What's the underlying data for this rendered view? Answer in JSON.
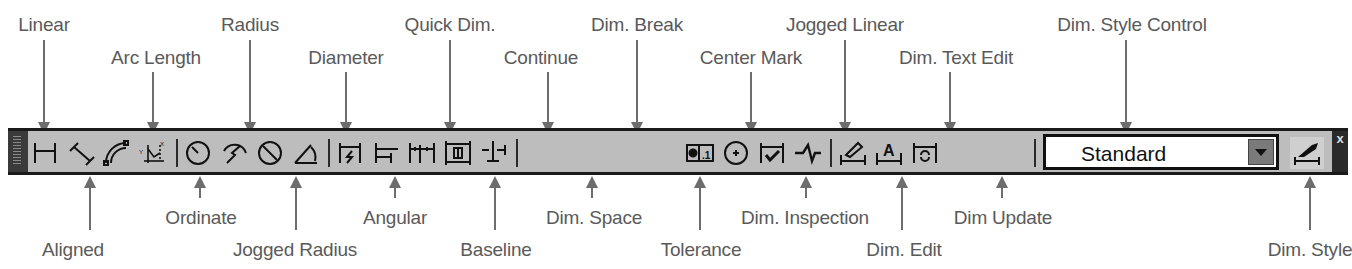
{
  "toolbar": {
    "name": "Dimension",
    "buttons": [
      {
        "id": "linear",
        "label": "Linear",
        "icon": "linear-dimension-icon"
      },
      {
        "id": "aligned",
        "label": "Aligned",
        "icon": "aligned-dimension-icon"
      },
      {
        "id": "arc_length",
        "label": "Arc Length",
        "icon": "arc-length-icon"
      },
      {
        "id": "ordinate",
        "label": "Ordinate",
        "icon": "ordinate-icon"
      },
      {
        "id": "radius",
        "label": "Radius",
        "icon": "radius-icon"
      },
      {
        "id": "jogged_radius",
        "label": "Jogged Radius",
        "icon": "jogged-radius-icon"
      },
      {
        "id": "diameter",
        "label": "Diameter",
        "icon": "diameter-icon"
      },
      {
        "id": "angular",
        "label": "Angular",
        "icon": "angular-icon"
      },
      {
        "id": "quick_dim",
        "label": "Quick Dim.",
        "icon": "quick-dimension-icon"
      },
      {
        "id": "baseline",
        "label": "Baseline",
        "icon": "baseline-icon"
      },
      {
        "id": "continue",
        "label": "Continue",
        "icon": "continue-icon"
      },
      {
        "id": "dim_space",
        "label": "Dim. Space",
        "icon": "dim-space-icon"
      },
      {
        "id": "dim_break",
        "label": "Dim. Break",
        "icon": "dim-break-icon"
      },
      {
        "id": "tolerance",
        "label": "Tolerance",
        "icon": "tolerance-icon"
      },
      {
        "id": "center_mark",
        "label": "Center Mark",
        "icon": "center-mark-icon"
      },
      {
        "id": "dim_inspection",
        "label": "Dim. Inspection",
        "icon": "dim-inspection-icon"
      },
      {
        "id": "jogged_linear",
        "label": "Jogged Linear",
        "icon": "jogged-linear-icon"
      },
      {
        "id": "dim_edit",
        "label": "Dim. Edit",
        "icon": "dim-edit-icon"
      },
      {
        "id": "dim_text_edit",
        "label": "Dim. Text Edit",
        "icon": "dim-text-edit-icon"
      },
      {
        "id": "dim_update",
        "label": "Dim Update",
        "icon": "dim-update-icon"
      },
      {
        "id": "dim_style",
        "label": "Dim. Style",
        "icon": "dim-style-icon"
      }
    ],
    "style_control": {
      "label": "Dim. Style Control",
      "value": "Standard"
    },
    "close_glyph": "x"
  },
  "callouts": {
    "top": [
      {
        "text": "Linear",
        "x": 44,
        "y": 14,
        "ax": 44,
        "ay1": 40,
        "ay2": 137
      },
      {
        "text": "Arc Length",
        "x": 156,
        "y": 47,
        "ax": 153,
        "ay1": 70,
        "ay2": 137
      },
      {
        "text": "Radius",
        "x": 250,
        "y": 14,
        "ax": 250,
        "ay1": 40,
        "ay2": 137
      },
      {
        "text": "Diameter",
        "x": 346,
        "y": 47,
        "ax": 346,
        "ay1": 70,
        "ay2": 137
      },
      {
        "text": "Quick Dim.",
        "x": 450,
        "y": 14,
        "ax": 450,
        "ay1": 40,
        "ay2": 137
      },
      {
        "text": "Continue",
        "x": 541,
        "y": 47,
        "ax": 548,
        "ay1": 70,
        "ay2": 137
      },
      {
        "text": "Dim. Break",
        "x": 637,
        "y": 14,
        "ax": 637,
        "ay1": 40,
        "ay2": 137
      },
      {
        "text": "Center Mark",
        "x": 751,
        "y": 47,
        "ax": 751,
        "ay1": 70,
        "ay2": 137
      },
      {
        "text": "Jogged Linear",
        "x": 845,
        "y": 14,
        "ax": 845,
        "ay1": 40,
        "ay2": 137
      },
      {
        "text": "Dim. Text Edit",
        "x": 956,
        "y": 47,
        "ax": 890,
        "ay1": 70,
        "ay2": 137
      },
      {
        "text": "Dim. Style Control",
        "x": 1132,
        "y": 14,
        "ax": 1126,
        "ay1": 40,
        "ay2": 137
      }
    ],
    "bottom": [
      {
        "text": "Aligned",
        "x": 73,
        "y": 239,
        "ax": 90,
        "ay1": 178,
        "ay2": 232
      },
      {
        "text": "Ordinate",
        "x": 201,
        "y": 207,
        "ax": 200,
        "ay1": 178,
        "ay2": 200
      },
      {
        "text": "Jogged Radius",
        "x": 295,
        "y": 239,
        "ax": 296,
        "ay1": 178,
        "ay2": 232
      },
      {
        "text": "Angular",
        "x": 395,
        "y": 207,
        "ax": 395,
        "ay1": 178,
        "ay2": 200
      },
      {
        "text": "Baseline",
        "x": 496,
        "y": 239,
        "ax": 495,
        "ay1": 178,
        "ay2": 232
      },
      {
        "text": "Dim. Space",
        "x": 594,
        "y": 207,
        "ax": 592,
        "ay1": 178,
        "ay2": 200
      },
      {
        "text": "Tolerance",
        "x": 701,
        "y": 239,
        "ax": 700,
        "ay1": 178,
        "ay2": 232
      },
      {
        "text": "Dim. Inspection",
        "x": 805,
        "y": 207,
        "ax": 806,
        "ay1": 178,
        "ay2": 200
      },
      {
        "text": "Dim. Edit",
        "x": 904,
        "y": 239,
        "ax": 902,
        "ay1": 178,
        "ay2": 232
      },
      {
        "text": "Dim Update",
        "x": 1003,
        "y": 207,
        "ax": 1002,
        "ay1": 178,
        "ay2": 200
      },
      {
        "text": "Dim. Style",
        "x": 1310,
        "y": 239,
        "ax": 1310,
        "ay1": 178,
        "ay2": 232
      }
    ]
  }
}
